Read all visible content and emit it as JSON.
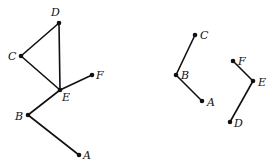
{
  "graphs": [
    {
      "name": "graph-left",
      "nodes": [
        {
          "id": "D",
          "x": 59,
          "y": 23,
          "lx": 51,
          "ly": 16
        },
        {
          "id": "C",
          "x": 21,
          "y": 56,
          "lx": 8,
          "ly": 60
        },
        {
          "id": "E",
          "x": 60,
          "y": 90,
          "lx": 62,
          "ly": 101
        },
        {
          "id": "F",
          "x": 92,
          "y": 75,
          "lx": 96,
          "ly": 79
        },
        {
          "id": "B",
          "x": 28,
          "y": 115,
          "lx": 15,
          "ly": 120
        },
        {
          "id": "A",
          "x": 79,
          "y": 155,
          "lx": 83,
          "ly": 159
        }
      ],
      "edges": [
        [
          "D",
          "C"
        ],
        [
          "D",
          "E"
        ],
        [
          "C",
          "E"
        ],
        [
          "E",
          "F"
        ],
        [
          "E",
          "B"
        ],
        [
          "B",
          "A"
        ]
      ]
    },
    {
      "name": "graph-right",
      "nodes": [
        {
          "id": "C",
          "x": 195,
          "y": 35,
          "lx": 200,
          "ly": 39
        },
        {
          "id": "B",
          "x": 176,
          "y": 75,
          "lx": 181,
          "ly": 79
        },
        {
          "id": "A",
          "x": 202,
          "y": 101,
          "lx": 207,
          "ly": 106
        },
        {
          "id": "F",
          "x": 233,
          "y": 61,
          "lx": 238,
          "ly": 65
        },
        {
          "id": "E",
          "x": 253,
          "y": 81,
          "lx": 258,
          "ly": 86
        },
        {
          "id": "D",
          "x": 230,
          "y": 122,
          "lx": 234,
          "ly": 127
        }
      ],
      "edges": [
        [
          "C",
          "B"
        ],
        [
          "B",
          "A"
        ],
        [
          "F",
          "E"
        ],
        [
          "E",
          "D"
        ]
      ]
    }
  ]
}
